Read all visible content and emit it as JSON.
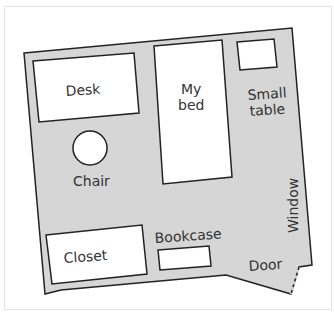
{
  "diagram": {
    "colors": {
      "floor": "#d6d6d6",
      "furniture": "#ffffff",
      "outline": "#222222",
      "text": "#333333"
    },
    "items": [
      {
        "id": "desk",
        "label": "Desk"
      },
      {
        "id": "bed",
        "label_line1": "My",
        "label_line2": "bed"
      },
      {
        "id": "small-table",
        "label_line1": "Small",
        "label_line2": "table"
      },
      {
        "id": "chair",
        "label": "Chair"
      },
      {
        "id": "closet",
        "label": "Closet"
      },
      {
        "id": "bookcase",
        "label": "Bookcase"
      },
      {
        "id": "window",
        "label": "Window"
      },
      {
        "id": "door",
        "label": "Door"
      }
    ]
  }
}
